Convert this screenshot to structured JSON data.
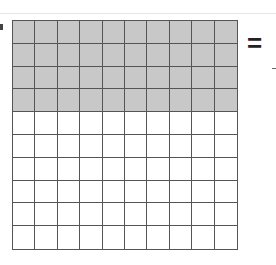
{
  "diagram": {
    "type": "hundred-grid",
    "rows": 10,
    "columns": 10,
    "shaded_rows": 4,
    "shaded_cells": 40,
    "total_cells": 100,
    "colors": {
      "shaded": "#c8c8c8",
      "unshaded": "#ffffff",
      "lines": "#555555"
    },
    "symbol": "="
  }
}
